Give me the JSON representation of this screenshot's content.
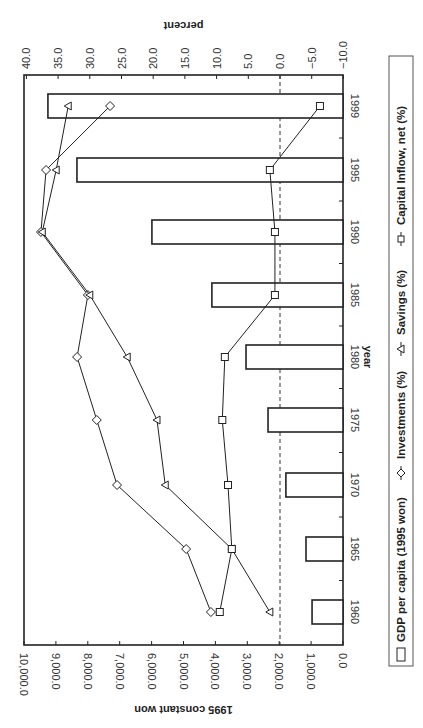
{
  "chart_data": {
    "type": "bar+line (dual axis, rotated 90°)",
    "orientation": "rotated 90 degrees clockwise",
    "categories": [
      "1960",
      "1965",
      "1970",
      "1975",
      "1980",
      "1985",
      "1990",
      "1995",
      "1999"
    ],
    "xlabel": "year",
    "ylabel_left": "1995 constant won",
    "ylabel_right": "percent",
    "ylim_left": [
      0,
      10000
    ],
    "ylim_right": [
      -10,
      40
    ],
    "left_ticks": [
      "0.0",
      "1,000.0",
      "2,000.0",
      "3,000.0",
      "4,000.0",
      "5,000.0",
      "6,000.0",
      "7,000.0",
      "8,000.0",
      "9,000.0",
      "10,000.0"
    ],
    "right_ticks": [
      "-10.0",
      "-5.0",
      "0.0",
      "5.0",
      "10.0",
      "15.0",
      "20.0",
      "25.0",
      "30.0",
      "35.0",
      "40.0"
    ],
    "reference_line": {
      "axis": "right",
      "value": 0,
      "style": "dashed"
    },
    "series": [
      {
        "name": "GDP per capita (1995 won)",
        "type": "bar",
        "axis": "left",
        "marker": "open-rect",
        "values": [
          970,
          1160,
          1790,
          2350,
          3040,
          4110,
          5990,
          8340,
          9250
        ]
      },
      {
        "name": "Investments (%)",
        "type": "line",
        "axis": "right",
        "marker": "diamond",
        "values": [
          10.9,
          14.8,
          25.7,
          28.9,
          32.0,
          30.3,
          37.7,
          36.9,
          26.8
        ]
      },
      {
        "name": "Savings (%)",
        "type": "line",
        "axis": "right",
        "marker": "triangle",
        "values": [
          1.6,
          7.6,
          18.1,
          19.4,
          24.1,
          30.0,
          37.5,
          35.3,
          33.4
        ]
      },
      {
        "name": "Capital Inflow, net (%)",
        "type": "line",
        "axis": "right",
        "marker": "square",
        "values": [
          9.5,
          7.6,
          8.2,
          9.1,
          8.7,
          0.8,
          0.8,
          1.6,
          -6.3
        ]
      }
    ],
    "legend_position": "bottom (rotated: right side)",
    "grid": false
  },
  "labels": {
    "x_title": "year",
    "left_title": "1995 constant won",
    "right_title": "percent",
    "legend": [
      "GDP per capita (1995 won)",
      "Investments (%)",
      "Savings (%)",
      "Capital Inflow, net (%)"
    ]
  }
}
